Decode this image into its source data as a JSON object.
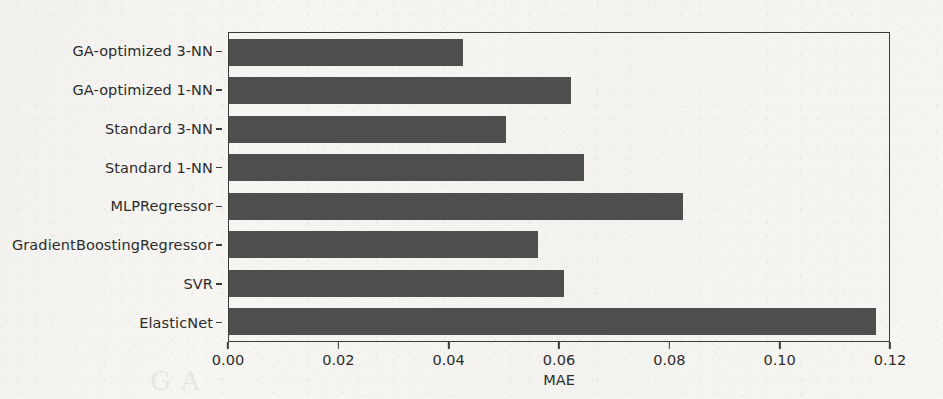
{
  "chart_data": {
    "type": "bar",
    "orientation": "horizontal",
    "title": "",
    "xlabel": "MAE",
    "ylabel": "",
    "categories": [
      "GA-optimized 3-NN",
      "GA-optimized 1-NN",
      "Standard 3-NN",
      "Standard 1-NN",
      "MLPRegressor",
      "GradientBoostingRegressor",
      "SVR",
      "ElasticNet"
    ],
    "values": [
      0.0426,
      0.0622,
      0.0504,
      0.0645,
      0.0825,
      0.0562,
      0.0609,
      0.1176
    ],
    "xlim": [
      0.0,
      0.12
    ],
    "xticks": [
      0.0,
      0.02,
      0.04,
      0.06,
      0.08,
      0.1,
      0.12
    ],
    "xtick_labels": [
      "0.00",
      "0.02",
      "0.04",
      "0.06",
      "0.08",
      "0.10",
      "0.12"
    ],
    "grid": false,
    "legend": null,
    "bar_color": "#4e4e4e",
    "axis_color": "#3a3a3a",
    "background_color": "#f6f5f2"
  },
  "scan_artifact": "GA"
}
